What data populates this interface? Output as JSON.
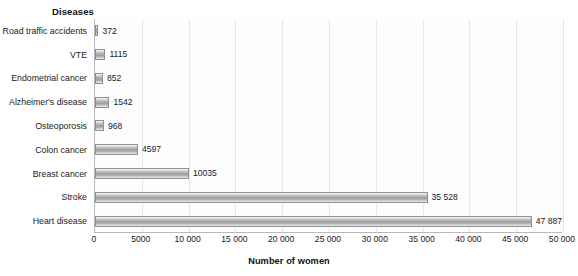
{
  "chart_data": {
    "type": "bar",
    "orientation": "horizontal",
    "title": "",
    "xlabel": "Number of women",
    "ylabel": "Diseases",
    "xlim": [
      0,
      50000
    ],
    "grid": true,
    "legend": "none",
    "categories": [
      "Road traffic accidents",
      "VTE",
      "Endometrial cancer",
      "Alzheimer's disease",
      "Osteoporosis",
      "Colon cancer",
      "Breast cancer",
      "Stroke",
      "Heart disease"
    ],
    "values": [
      372,
      1115,
      852,
      1542,
      968,
      4597,
      10035,
      35528,
      47887
    ],
    "value_labels": [
      "372",
      "1115",
      "852",
      "1542",
      "968",
      "4597",
      "10035",
      "35 528",
      "47 887"
    ],
    "xticks": [
      0,
      5000,
      10000,
      15000,
      20000,
      25000,
      30000,
      35000,
      40000,
      45000,
      50000
    ],
    "xtick_labels": [
      "0",
      "5000",
      "10 000",
      "15 000",
      "20 000",
      "25 000",
      "30 000",
      "35 000",
      "40 000",
      "45 000",
      "50 000"
    ]
  },
  "colors": {
    "bar_fill_mid": "#9c9c9c",
    "bar_border": "#8f8f8f",
    "gridline": "#e6e6e6",
    "axis_line": "#b9b9b9",
    "text": "#1a1a1a",
    "background": "#ffffff"
  }
}
